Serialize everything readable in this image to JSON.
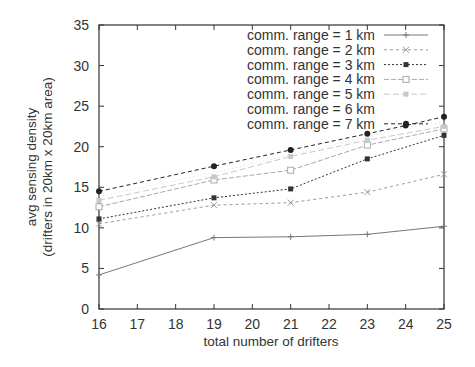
{
  "chart_data": {
    "type": "line",
    "title": "",
    "xlabel": "total number of drifters",
    "ylabel": "avg sensing density",
    "ylabel2": "(drifters in 20km x 20km area)",
    "xlim": [
      16,
      25
    ],
    "ylim": [
      0,
      35
    ],
    "xticks": [
      16,
      17,
      18,
      19,
      20,
      21,
      22,
      23,
      24,
      25
    ],
    "yticks": [
      0,
      5,
      10,
      15,
      20,
      25,
      30,
      35
    ],
    "grid": false,
    "legend_position": "top-right (inside)",
    "series": [
      {
        "name": "comm. range = 1 km",
        "color": "#777777",
        "dash": "",
        "marker": "plus",
        "x": [
          16,
          19,
          21,
          23,
          25
        ],
        "values": [
          4.2,
          8.8,
          8.9,
          9.2,
          10.2
        ]
      },
      {
        "name": "comm. range = 2 km",
        "color": "#9a9a9a",
        "dash": "3,3",
        "marker": "cross",
        "x": [
          16,
          19,
          21,
          23,
          25
        ],
        "values": [
          10.5,
          12.8,
          13.1,
          14.4,
          16.6
        ]
      },
      {
        "name": "comm. range = 3 km",
        "color": "#333333",
        "dash": "2,2",
        "marker": "filled-square",
        "x": [
          16,
          19,
          21,
          23,
          25
        ],
        "values": [
          11.1,
          13.7,
          14.8,
          18.5,
          21.4
        ]
      },
      {
        "name": "comm. range = 4 km",
        "color": "#aaaaaa",
        "dash": "5,2",
        "marker": "open-square",
        "x": [
          16,
          19,
          21,
          23,
          25
        ],
        "values": [
          12.6,
          15.9,
          17.1,
          20.2,
          22.2
        ]
      },
      {
        "name": "comm. range = 5 km",
        "color": "#c8c8c8",
        "dash": "6,3",
        "marker": "filled-square-light",
        "x": [
          16,
          19,
          21,
          23,
          25
        ],
        "values": [
          13.4,
          16.3,
          18.8,
          20.8,
          22.5
        ]
      },
      {
        "name": "comm. range = 6 km",
        "color": "#dddddd",
        "dash": "1,3",
        "marker": "none",
        "x": [
          16,
          19,
          21,
          23,
          24,
          25
        ],
        "values": [
          13.9,
          16.8,
          19.0,
          21.2,
          22.4,
          23.0
        ]
      },
      {
        "name": "comm. range = 7 km",
        "color": "#222222",
        "dash": "4,3",
        "marker": "filled-circle",
        "x": [
          16,
          19,
          21,
          23,
          24,
          25
        ],
        "values": [
          14.5,
          17.6,
          19.6,
          21.6,
          22.6,
          23.7
        ]
      }
    ]
  }
}
